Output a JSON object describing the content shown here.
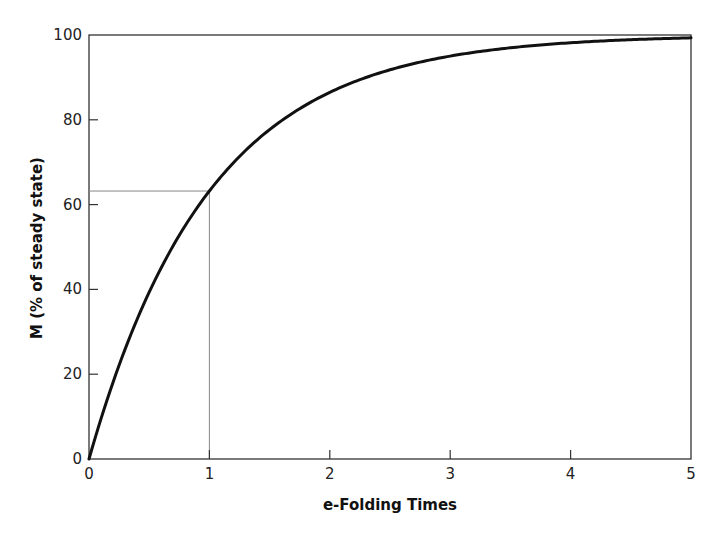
{
  "chart_data": {
    "type": "line",
    "title": "",
    "xlabel": "e-Folding Times",
    "ylabel": "M (% of steady state)",
    "xlim": [
      0,
      5
    ],
    "ylim": [
      0,
      100
    ],
    "xticks": [
      "0",
      "1",
      "2",
      "3",
      "4",
      "5"
    ],
    "yticks": [
      "0",
      "20",
      "40",
      "60",
      "80",
      "100"
    ],
    "grid": false,
    "legend": null,
    "series": [
      {
        "name": "M = 100(1 - e^-t)",
        "x": [
          0,
          0.25,
          0.5,
          0.75,
          1,
          1.5,
          2,
          2.5,
          3,
          3.5,
          4,
          4.5,
          5
        ],
        "values": [
          0,
          22.1,
          39.3,
          52.8,
          63.2,
          77.7,
          86.5,
          91.8,
          95.0,
          97.0,
          98.2,
          98.9,
          99.3
        ]
      }
    ],
    "annotations": [
      {
        "type": "reference-lines",
        "x": 1,
        "y": 63.2,
        "description": "Thin lines from axes marking 63% at one e-folding time"
      }
    ]
  },
  "labels": {
    "xlabel": "e-Folding Times",
    "ylabel": "M (% of steady state)",
    "xticks": [
      "0",
      "1",
      "2",
      "3",
      "4",
      "5"
    ],
    "yticks": [
      "0",
      "20",
      "40",
      "60",
      "80",
      "100"
    ]
  }
}
